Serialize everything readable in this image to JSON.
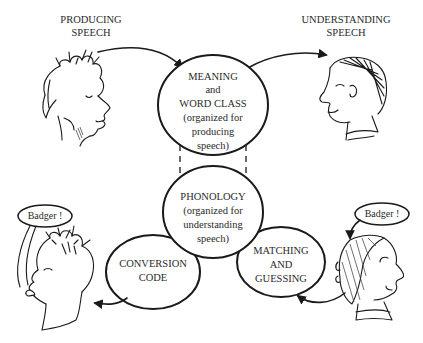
{
  "captions": {
    "producing": [
      "PRODUCING",
      "SPEECH"
    ],
    "understanding": [
      "UNDERSTANDING",
      "SPEECH"
    ]
  },
  "nodes": {
    "meaning": [
      "MEANING",
      "and",
      "WORD CLASS",
      "(organized for",
      "producing",
      "speech)"
    ],
    "phonology": [
      "PHONOLOGY",
      "(organized for",
      "understanding",
      "speech)"
    ],
    "conversion": [
      "CONVERSION",
      "CODE"
    ],
    "matching": [
      "MATCHING",
      "AND",
      "GUESSING"
    ]
  },
  "bubbles": {
    "left": "Badger !",
    "right": "Badger !"
  },
  "figures": [
    "speaker-top-left",
    "listener-top-right",
    "speaker-bottom-left",
    "listener-bottom-right"
  ],
  "colors": {
    "ink": "#1a1a1a",
    "text": "#2a2a2a",
    "background": "#ffffff"
  }
}
